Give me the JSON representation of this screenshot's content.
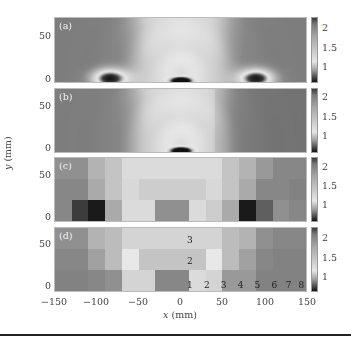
{
  "chart_data": [
    {
      "panel": "(a)",
      "type": "heatmap",
      "description": "Continuous field; light central band with arc pattern, dark spots near (-90,0), (0,0), (90,0)",
      "xlim": [
        -150,
        150
      ],
      "ylim": [
        -10,
        70
      ],
      "yticks": [
        "0",
        "50"
      ],
      "colorbar": {
        "ticks": [
          "2",
          "1.5",
          "1"
        ],
        "range": [
          0.7,
          2.3
        ]
      }
    },
    {
      "panel": "(b)",
      "type": "heatmap",
      "description": "Continuous field similar to (a), smoother; dark spot at (0,0), darker right side",
      "xlim": [
        -150,
        150
      ],
      "ylim": [
        -10,
        70
      ],
      "yticks": [
        "0",
        "50"
      ],
      "colorbar": {
        "ticks": [
          "2",
          "1.5",
          "1"
        ],
        "range": [
          0.7,
          2.3
        ]
      }
    },
    {
      "panel": "(c)",
      "type": "heatmap",
      "description": "Block-averaged field, 3 rows x 15 columns (20 mm each)",
      "xlim": [
        -150,
        150
      ],
      "ylim": [
        -10,
        70
      ],
      "yticks": [
        "0",
        "50"
      ],
      "colorbar": {
        "ticks": [
          "2",
          "1.5",
          "1"
        ],
        "range": [
          0.7,
          2.3
        ]
      },
      "values": [
        [
          1.75,
          1.75,
          1.55,
          1.45,
          1.3,
          1.3,
          1.3,
          1.3,
          1.3,
          1.3,
          1.45,
          1.55,
          1.7,
          1.8,
          1.8
        ],
        [
          1.8,
          1.8,
          1.6,
          1.45,
          1.15,
          1.4,
          1.4,
          1.4,
          1.4,
          1.15,
          1.45,
          1.6,
          1.8,
          1.8,
          1.85
        ],
        [
          1.8,
          0.9,
          0.75,
          1.6,
          1.3,
          1.3,
          1.75,
          1.75,
          1.3,
          1.4,
          1.6,
          0.75,
          0.95,
          1.75,
          1.8
        ]
      ]
    },
    {
      "panel": "(d)",
      "type": "heatmap",
      "description": "Block-averaged field, 3 rows x 15 columns with labeled blocks",
      "xlim": [
        -150,
        150
      ],
      "ylim": [
        -10,
        70
      ],
      "yticks": [
        "0",
        "50"
      ],
      "colorbar": {
        "ticks": [
          "2",
          "1.5",
          "1"
        ],
        "range": [
          0.7,
          2.3
        ]
      },
      "values": [
        [
          1.75,
          1.75,
          1.55,
          1.5,
          1.35,
          1.35,
          1.35,
          1.35,
          1.35,
          1.35,
          1.5,
          1.55,
          1.75,
          1.8,
          1.8
        ],
        [
          1.8,
          1.8,
          1.65,
          1.5,
          1.2,
          1.45,
          1.45,
          1.45,
          1.45,
          1.2,
          1.5,
          1.65,
          1.8,
          1.85,
          1.85
        ],
        [
          1.85,
          1.85,
          1.8,
          1.75,
          1.35,
          1.35,
          1.8,
          1.8,
          1.3,
          1.35,
          1.7,
          1.7,
          1.85,
          1.85,
          1.85
        ]
      ],
      "annotations": [
        {
          "text": "3",
          "x": 10,
          "y": 55
        },
        {
          "text": "2",
          "x": 10,
          "y": 30
        },
        {
          "text": "1",
          "x": 10,
          "y": 0
        },
        {
          "text": "2",
          "x": 30,
          "y": 0
        },
        {
          "text": "3",
          "x": 50,
          "y": 0
        },
        {
          "text": "4",
          "x": 70,
          "y": 0
        },
        {
          "text": "5",
          "x": 90,
          "y": 0
        },
        {
          "text": "6",
          "x": 110,
          "y": 0
        },
        {
          "text": "7",
          "x": 127,
          "y": 0
        },
        {
          "text": "8",
          "x": 142,
          "y": 0
        }
      ]
    }
  ],
  "axes": {
    "xlabel_var": "x",
    "xlabel_unit": " (mm)",
    "ylabel_var": "y",
    "ylabel_unit": " (mm)",
    "xticks": [
      "−150",
      "−100",
      "−50",
      "0",
      "50",
      "100",
      "150"
    ],
    "yticks": [
      "0",
      "50"
    ]
  },
  "panels": {
    "a": {
      "label": "(a)"
    },
    "b": {
      "label": "(b)"
    },
    "c": {
      "label": "(c)"
    },
    "d": {
      "label": "(d)"
    }
  },
  "colorbar_ticks": [
    "2",
    "1.5",
    "1"
  ]
}
